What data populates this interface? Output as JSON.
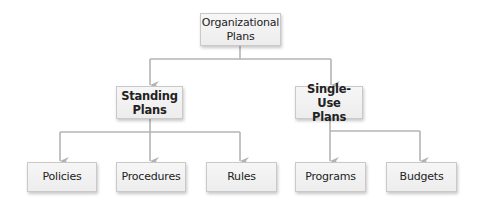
{
  "diagram": {
    "type": "hierarchy",
    "colors": {
      "line": "#b4b4b4",
      "box_fill": "#f1f1f1",
      "box_border": "#c9c9c9",
      "text": "#222222"
    },
    "root": {
      "label": "Organizational\nPlans"
    },
    "level1": [
      {
        "label": "Standing\nPlans"
      },
      {
        "label": "Single-Use\nPlans"
      }
    ],
    "level2_standing": [
      {
        "label": "Policies"
      },
      {
        "label": "Procedures"
      },
      {
        "label": "Rules"
      }
    ],
    "level2_single_use": [
      {
        "label": "Programs"
      },
      {
        "label": "Budgets"
      }
    ]
  }
}
